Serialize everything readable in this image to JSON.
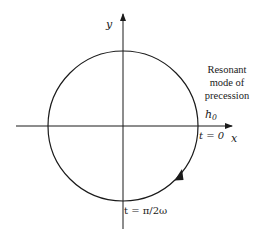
{
  "diagram": {
    "axes": {
      "x_label": "x",
      "y_label": "y"
    },
    "circle": {
      "center": [
        123,
        126
      ],
      "radius": 75,
      "direction": "clockwise"
    },
    "labels": {
      "h0_main": "h",
      "h0_sub": "0",
      "t0": "t = 0",
      "t_quarter": "t = π/2ω",
      "note_line1": "Resonant",
      "note_line2": "mode of",
      "note_line3": "precession"
    },
    "colors": {
      "stroke": "#1a1a1a",
      "background": "#ffffff"
    }
  }
}
